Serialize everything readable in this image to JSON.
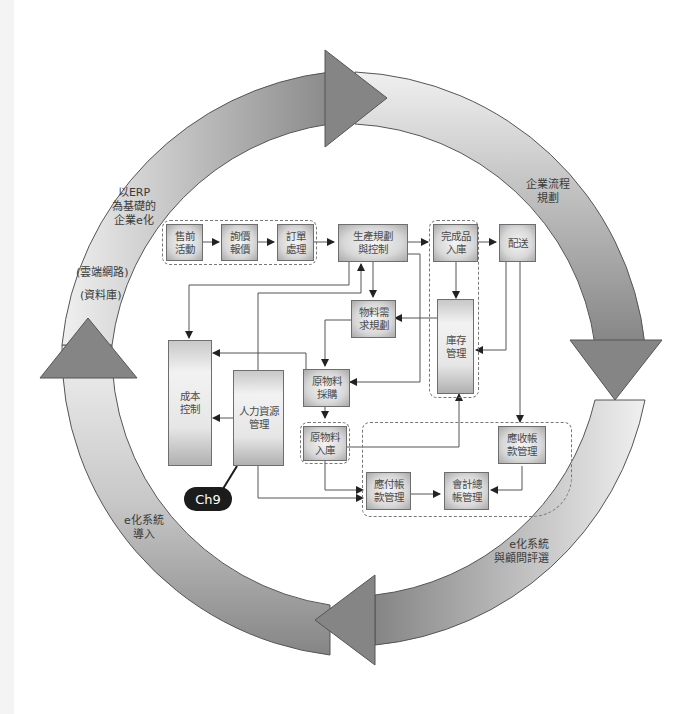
{
  "cycle": {
    "stages": [
      {
        "id": "erp",
        "lines": [
          "以ERP",
          "為基礎的",
          "企業e化"
        ]
      },
      {
        "id": "cloud",
        "lines": [
          "(雲端網路)"
        ]
      },
      {
        "id": "db",
        "lines": [
          "(資料庫)"
        ]
      },
      {
        "id": "process",
        "lines": [
          "企業流程",
          "規劃"
        ]
      },
      {
        "id": "select",
        "lines": [
          "e化系統",
          "與顧問評選"
        ]
      },
      {
        "id": "import",
        "lines": [
          "e化系統",
          "導入"
        ]
      }
    ],
    "colors": {
      "arrow_dark": "#7a7a7a",
      "arrow_light": "#eeeeee",
      "outline": "#555555"
    }
  },
  "boxes": {
    "presale": [
      "售前",
      "活動"
    ],
    "quote": [
      "詢價",
      "報價"
    ],
    "order": [
      "訂單",
      "處理"
    ],
    "production": [
      "生產規劃",
      "與控制"
    ],
    "finished": [
      "完成品",
      "入庫"
    ],
    "delivery": [
      "配送"
    ],
    "mrp": [
      "物料需",
      "求規劃"
    ],
    "inventory": [
      "庫存",
      "管理"
    ],
    "cost": [
      "成本",
      "控制"
    ],
    "hr": [
      "人力資源",
      "管理"
    ],
    "purchase": [
      "原物料",
      "採購"
    ],
    "raw_in": [
      "原物料",
      "入庫"
    ],
    "ar": [
      "應收帳",
      "款管理"
    ],
    "ap": [
      "應付帳",
      "款管理"
    ],
    "gl": [
      "會計總",
      "帳管理"
    ]
  },
  "badge": {
    "label": "Ch9"
  }
}
